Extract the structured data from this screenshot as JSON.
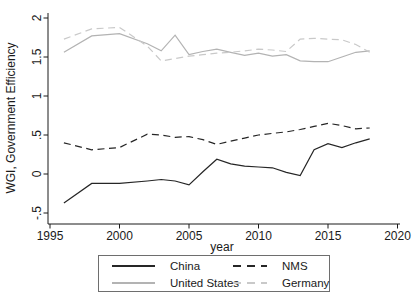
{
  "figure": {
    "background": "#ffffff",
    "axis_color": "#1a1a1a",
    "text_color": "#1a1a1a"
  },
  "chart_data": {
    "type": "line",
    "title": "",
    "xlabel": "year",
    "ylabel": "WGI, Government Efficiency",
    "xlim": [
      1995,
      2020.5
    ],
    "ylim": [
      -0.5,
      2
    ],
    "grid": false,
    "legend_position": "bottom",
    "xticks": [
      1995,
      2000,
      2005,
      2010,
      2015,
      2020
    ],
    "xtick_labels": [
      "1995",
      "2000",
      "2005",
      "2010",
      "2015",
      "2020"
    ],
    "yticks": [
      -0.5,
      0,
      0.5,
      1,
      1.5,
      2
    ],
    "ytick_labels": [
      "-.5",
      "0",
      ".5",
      "1",
      "1.5",
      "2"
    ],
    "x": [
      1996,
      1998,
      2000,
      2002,
      2003,
      2004,
      2005,
      2006,
      2007,
      2008,
      2009,
      2010,
      2011,
      2012,
      2013,
      2014,
      2015,
      2016,
      2017,
      2018
    ],
    "series": [
      {
        "name": "China",
        "style": "solid",
        "color": "#262626",
        "values": [
          -0.37,
          -0.12,
          -0.12,
          -0.09,
          -0.07,
          -0.09,
          -0.14,
          0.03,
          0.19,
          0.13,
          0.1,
          0.09,
          0.08,
          0.02,
          -0.02,
          0.31,
          0.39,
          0.34,
          0.4,
          0.45
        ]
      },
      {
        "name": "NMS",
        "style": "dashed",
        "color": "#262626",
        "values": [
          0.4,
          0.31,
          0.34,
          0.51,
          0.5,
          0.47,
          0.48,
          0.44,
          0.38,
          0.42,
          0.46,
          0.5,
          0.52,
          0.54,
          0.57,
          0.61,
          0.65,
          0.62,
          0.58,
          0.59
        ]
      },
      {
        "name": "United States",
        "style": "solid",
        "color": "#b3b3b3",
        "values": [
          1.56,
          1.77,
          1.8,
          1.67,
          1.58,
          1.78,
          1.53,
          1.57,
          1.6,
          1.56,
          1.52,
          1.55,
          1.51,
          1.53,
          1.45,
          1.44,
          1.44,
          1.5,
          1.56,
          1.58
        ]
      },
      {
        "name": "Germany",
        "style": "dashed",
        "color": "#c9c9c9",
        "values": [
          1.73,
          1.86,
          1.88,
          1.64,
          1.45,
          1.48,
          1.51,
          1.53,
          1.55,
          1.56,
          1.58,
          1.6,
          1.59,
          1.57,
          1.73,
          1.74,
          1.73,
          1.72,
          1.66,
          1.56
        ]
      }
    ]
  },
  "legend": {
    "items": [
      {
        "label": "China",
        "style": "solid",
        "color": "#262626"
      },
      {
        "label": "NMS",
        "style": "dashed",
        "color": "#262626"
      },
      {
        "label": "United States",
        "style": "solid",
        "color": "#b3b3b3"
      },
      {
        "label": "Germany",
        "style": "dashed",
        "color": "#c9c9c9"
      }
    ]
  }
}
